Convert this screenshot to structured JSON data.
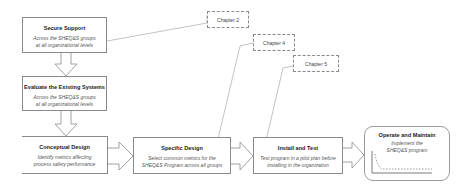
{
  "steps": [
    {
      "title": "Secure  Support",
      "desc_line1": "Across the SHEQ&S groups",
      "desc_line2": "at all organizational levels"
    },
    {
      "title": "Evaluate the Existing Systems",
      "desc_line1": "Across the SHEQ&S groups",
      "desc_line2": "at all organizational levels"
    },
    {
      "title": "Conceptual Design",
      "desc_line1": "Identify metrics affecting",
      "desc_line2": "process safety performance"
    },
    {
      "title": "Specific Design",
      "desc_line1": "Select common metrics for the",
      "desc_line2": "SHEQ&S Program across all groups"
    },
    {
      "title": "Install and Test",
      "desc_line1": "Test program in a pilot plan before",
      "desc_line2": "installing in the organization"
    },
    {
      "title": "Operate and Maintain",
      "desc_line1": "Implement the",
      "desc_line2": "SHEQ&S program"
    }
  ],
  "callouts": [
    {
      "label": "Chapter 2",
      "points_to": "Secure  Support"
    },
    {
      "label": "Chapter 4",
      "points_to": "Specific Design"
    },
    {
      "label": "Chapter 5",
      "points_to": "Install and Test"
    }
  ],
  "colors": {
    "box_border": "#8a8a8a",
    "arrow_stroke": "#8a8a8a",
    "callout_border": "#8a8a8a",
    "title_text": "#222222",
    "desc_text": "#555555"
  }
}
